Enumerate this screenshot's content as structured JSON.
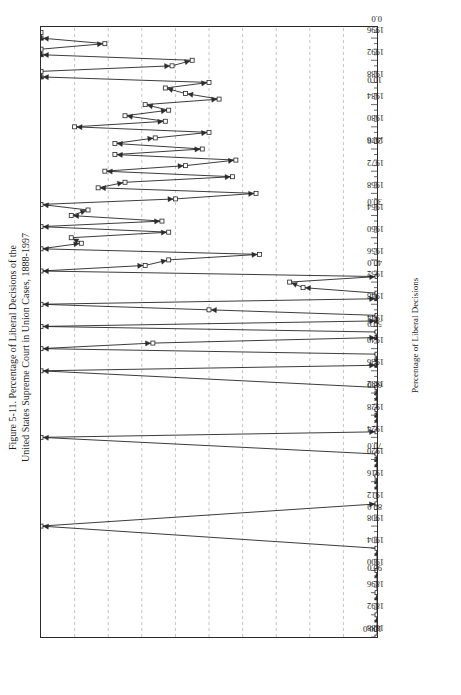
{
  "figure": {
    "title_line1": "Figure 5-11.  Percentage of Liberal Decisions of the",
    "title_line2": "United States Supreme Court in Union Cases, 1888-1997"
  },
  "chart_data": {
    "type": "line",
    "title": "Figure 5-11.  Percentage of Liberal Decisions of the United States Supreme Court in Union Cases, 1888-1997",
    "orientation": "page-rotated-90-ccw",
    "xlabel": "Term Year",
    "ylabel": "Percentage of Liberal Decisions",
    "xlim": [
      1888,
      1998
    ],
    "ylim": [
      0.0,
      100.0
    ],
    "xticks": [
      1888,
      1892,
      1896,
      1900,
      1904,
      1908,
      1912,
      1916,
      1920,
      1924,
      1928,
      1932,
      1936,
      1940,
      1944,
      1948,
      1952,
      1956,
      1960,
      1964,
      1968,
      1972,
      1976,
      1980,
      1984,
      1988,
      1992,
      1996
    ],
    "xtick_labels": [
      "1888",
      "1892",
      "1896",
      "1900",
      "1904",
      "1908",
      "1912",
      "1916",
      "1920",
      "1924",
      "1928",
      "1932",
      "1936",
      "1940",
      "1944",
      "1948",
      "1952",
      "1956",
      "1960",
      "1964",
      "1968",
      "1972",
      "1976",
      "1980",
      "1984",
      "1988",
      "1992",
      "1996"
    ],
    "yticks": [
      0.0,
      10.0,
      20.0,
      30.0,
      40.0,
      50.0,
      60.0,
      70.0,
      80.0,
      90.0,
      100.0
    ],
    "ytick_labels": [
      "0.0",
      "10.0",
      "20.0",
      "30.0",
      "40.0",
      "50.0",
      "60.0",
      "70.0",
      "80.0",
      "90.0",
      "100.0"
    ],
    "grid": "vertical-dashed-on-percentage-axis",
    "legend": null,
    "marker": "open-square-and-filled-triangle",
    "series": [
      {
        "name": "Percentage of Liberal Decisions",
        "x": [
          1888,
          1892,
          1896,
          1900,
          1904,
          1908,
          1912,
          1916,
          1917,
          1920,
          1921,
          1924,
          1925,
          1928,
          1929,
          1932,
          1933,
          1936,
          1937,
          1938,
          1939,
          1940,
          1941,
          1942,
          1943,
          1944,
          1945,
          1946,
          1947,
          1948,
          1949,
          1950,
          1951,
          1952,
          1953,
          1954,
          1955,
          1956,
          1957,
          1958,
          1959,
          1960,
          1961,
          1962,
          1963,
          1964,
          1965,
          1966,
          1967,
          1968,
          1969,
          1970,
          1971,
          1972,
          1973,
          1974,
          1975,
          1976,
          1977,
          1978,
          1979,
          1980,
          1981,
          1982,
          1983,
          1984,
          1985,
          1986,
          1987,
          1988,
          1989,
          1990,
          1991,
          1992,
          1993,
          1994,
          1995,
          1996,
          1997
        ],
        "y": [
          0.0,
          0.0,
          0.0,
          0.0,
          0.0,
          100.0,
          0.0,
          0.0,
          0.0,
          0.0,
          0.0,
          100.0,
          0.0,
          0.0,
          0.0,
          0.0,
          0.0,
          100.0,
          0.0,
          0.0,
          0.0,
          100.0,
          66.7,
          0.0,
          0.0,
          100.0,
          0.0,
          0.0,
          50.0,
          100.0,
          0.0,
          0.0,
          22.0,
          26.0,
          0.0,
          100.0,
          69.0,
          62.0,
          35.0,
          100.0,
          88.0,
          91.0,
          62.0,
          100.0,
          64.0,
          91.0,
          86.0,
          100.0,
          60.0,
          36.0,
          83.0,
          75.0,
          43.0,
          81.0,
          57.0,
          42.0,
          78.0,
          52.0,
          78.0,
          66.0,
          50.0,
          90.0,
          63.0,
          75.0,
          62.0,
          69.0,
          47.0,
          57.0,
          63.0,
          50.0,
          100.0,
          100.0,
          61.0,
          55.0,
          100.0,
          100.0,
          81.0,
          100.0,
          100.0
        ]
      }
    ]
  },
  "axes": {
    "x_axis_title": "Term Year",
    "y_axis_title": "Percentage of Liberal Decisions"
  }
}
